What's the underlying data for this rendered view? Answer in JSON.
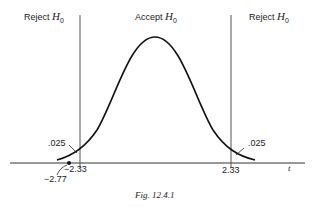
{
  "figure": {
    "regions": {
      "left": {
        "text": "Reject ",
        "symbol": "H",
        "sub": "0"
      },
      "center": {
        "text": "Accept ",
        "symbol": "H",
        "sub": "0"
      },
      "right": {
        "text": "Reject ",
        "symbol": "H",
        "sub": "0"
      }
    },
    "tail_left_area": ".025",
    "tail_right_area": ".025",
    "critical_left": "−2.33",
    "critical_right": "2.33",
    "observed_value": "−2.77",
    "axis_label": "t",
    "caption": "Fig. 12.4.1"
  }
}
